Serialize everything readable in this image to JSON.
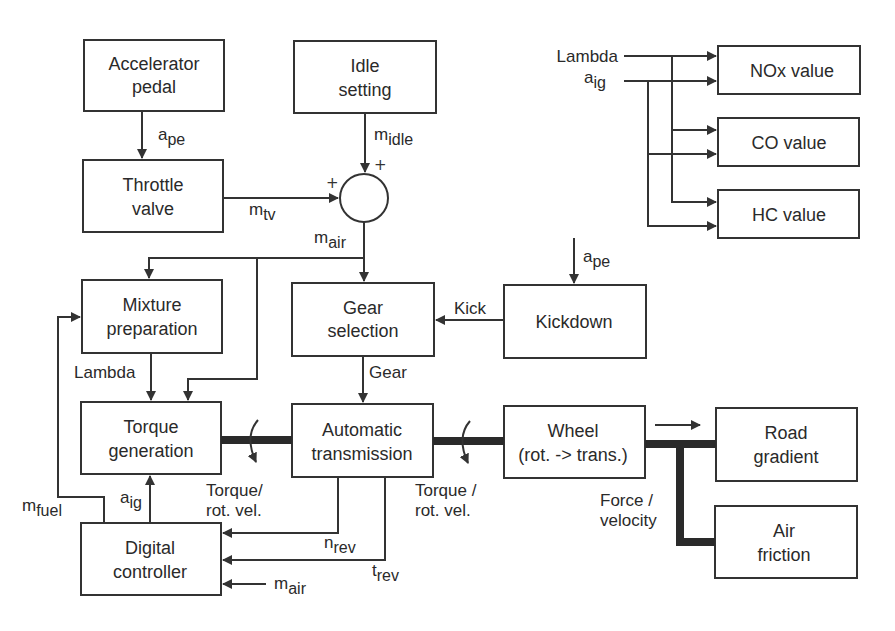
{
  "blocks": {
    "accelerator_pedal": {
      "line1": "Accelerator",
      "line2": "pedal"
    },
    "idle_setting": {
      "line1": "Idle",
      "line2": "setting"
    },
    "throttle_valve": {
      "line1": "Throttle",
      "line2": "valve"
    },
    "nox_value": {
      "label": "NOx value"
    },
    "co_value": {
      "label": "CO value"
    },
    "hc_value": {
      "label": "HC value"
    },
    "mixture_preparation": {
      "line1": "Mixture",
      "line2": "preparation"
    },
    "gear_selection": {
      "line1": "Gear",
      "line2": "selection"
    },
    "kickdown": {
      "label": "Kickdown"
    },
    "torque_generation": {
      "line1": "Torque",
      "line2": "generation"
    },
    "automatic_transmission": {
      "line1": "Automatic",
      "line2": "transmission"
    },
    "wheel": {
      "line1": "Wheel",
      "line2": "(rot. -> trans.)"
    },
    "road_gradient": {
      "line1": "Road",
      "line2": "gradient"
    },
    "air_friction": {
      "line1": "Air",
      "line2": "friction"
    },
    "digital_controller": {
      "line1": "Digital",
      "line2": "controller"
    }
  },
  "summing_junction": {
    "plus_top": "+",
    "plus_left": "+"
  },
  "signals": {
    "a_pe_1": {
      "base": "a",
      "sub": "pe"
    },
    "m_idle": {
      "base": "m",
      "sub": "idle"
    },
    "m_tv": {
      "base": "m",
      "sub": "tv"
    },
    "m_air_1": {
      "base": "m",
      "sub": "air"
    },
    "lambda_in": {
      "text": "Lambda"
    },
    "a_ig_in": {
      "base": "a",
      "sub": "ig"
    },
    "a_pe_2": {
      "base": "a",
      "sub": "pe"
    },
    "kick": {
      "text": "Kick"
    },
    "lambda_mix": {
      "text": "Lambda"
    },
    "gear": {
      "text": "Gear"
    },
    "torque_rot_vel_1": {
      "line1": "Torque/",
      "line2": "rot. vel."
    },
    "torque_rot_vel_2": {
      "line1": "Torque /",
      "line2": "rot. vel."
    },
    "force_velocity": {
      "line1": "Force /",
      "line2": "velocity"
    },
    "m_fuel": {
      "base": "m",
      "sub": "fuel"
    },
    "a_ig_ctrl": {
      "base": "a",
      "sub": "ig"
    },
    "n_rev": {
      "base": "n",
      "sub": "rev"
    },
    "t_rev": {
      "base": "t",
      "sub": "rev"
    },
    "m_air_2": {
      "base": "m",
      "sub": "air"
    }
  },
  "colors": {
    "line": "#333333",
    "text": "#2a2a2a",
    "background": "#ffffff"
  }
}
